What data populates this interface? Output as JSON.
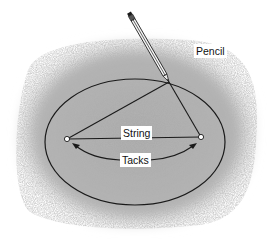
{
  "diagram": {
    "labels": {
      "pencil": "Pencil",
      "string": "String",
      "tacks": "Tacks"
    },
    "colors": {
      "background_texture": "#b8b8b8",
      "line": "#1a1a1a",
      "label_bg": "#ffffff"
    },
    "geometry": {
      "ellipse": {
        "cx": 135,
        "cy": 142,
        "rx": 90,
        "ry": 63
      },
      "tack_left": {
        "x": 67,
        "y": 139
      },
      "tack_right": {
        "x": 201,
        "y": 137
      },
      "pencil_tip": {
        "x": 169,
        "y": 82
      },
      "pencil_end": {
        "x": 208,
        "y": 14
      }
    }
  }
}
